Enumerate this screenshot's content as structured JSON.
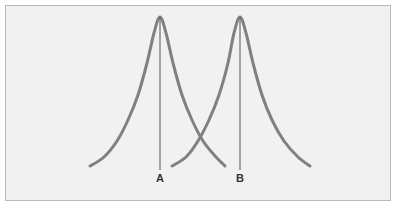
{
  "figure": {
    "background_color": "#f1f1f1",
    "page_color": "#ffffff",
    "border_color": "#b9b9b9",
    "curve_color": "#808080",
    "mean_line_color": "#555555",
    "label_color": "#333333",
    "curve_stroke_width": 3,
    "mean_line_stroke_width": 1
  },
  "labels": {
    "curve_a": "A",
    "curve_b": "B"
  },
  "chart_data": {
    "type": "line",
    "xlabel": "",
    "ylabel": "",
    "grid": false,
    "legend_position": "none",
    "annotations": [
      {
        "text": "A",
        "x": 160,
        "y": 182,
        "describes": "mean of left distribution"
      },
      {
        "text": "B",
        "x": 240,
        "y": 182,
        "describes": "mean of right distribution"
      }
    ],
    "geometry": {
      "baseline_y": 166,
      "peak_y": 17,
      "crossing_point": {
        "x": 200,
        "y": 117
      }
    },
    "series": [
      {
        "name": "A",
        "label": "A",
        "color": "#808080",
        "mean_x": 160,
        "peak_y": 17,
        "x_start": 90,
        "x_end": 225,
        "mean_line": {
          "x": 160,
          "y_top": 17,
          "y_bottom": 170
        },
        "points": [
          {
            "x": 90,
            "y": 166
          },
          {
            "x": 104,
            "y": 157
          },
          {
            "x": 117,
            "y": 141
          },
          {
            "x": 128,
            "y": 120
          },
          {
            "x": 138,
            "y": 95
          },
          {
            "x": 147,
            "y": 63
          },
          {
            "x": 154,
            "y": 33
          },
          {
            "x": 160,
            "y": 17
          },
          {
            "x": 166,
            "y": 33
          },
          {
            "x": 173,
            "y": 63
          },
          {
            "x": 182,
            "y": 95
          },
          {
            "x": 192,
            "y": 120
          },
          {
            "x": 203,
            "y": 141
          },
          {
            "x": 216,
            "y": 157
          },
          {
            "x": 225,
            "y": 166
          }
        ]
      },
      {
        "name": "B",
        "label": "B",
        "color": "#808080",
        "mean_x": 240,
        "peak_y": 17,
        "x_start": 172,
        "x_end": 310,
        "mean_line": {
          "x": 240,
          "y_top": 17,
          "y_bottom": 170
        },
        "points": [
          {
            "x": 172,
            "y": 166
          },
          {
            "x": 186,
            "y": 157
          },
          {
            "x": 198,
            "y": 141
          },
          {
            "x": 209,
            "y": 120
          },
          {
            "x": 219,
            "y": 95
          },
          {
            "x": 228,
            "y": 63
          },
          {
            "x": 234,
            "y": 33
          },
          {
            "x": 240,
            "y": 17
          },
          {
            "x": 246,
            "y": 33
          },
          {
            "x": 253,
            "y": 63
          },
          {
            "x": 262,
            "y": 95
          },
          {
            "x": 272,
            "y": 120
          },
          {
            "x": 284,
            "y": 141
          },
          {
            "x": 298,
            "y": 157
          },
          {
            "x": 310,
            "y": 166
          }
        ]
      }
    ]
  }
}
